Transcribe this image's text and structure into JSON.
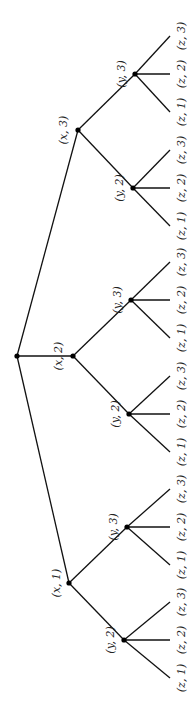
{
  "diagram": {
    "type": "tree",
    "orientation": "rotated-90-ccw",
    "colors": {
      "edge": "#111111",
      "node": "#000000",
      "label": "#222222",
      "background": "#ffffff"
    },
    "root": {
      "id": "root",
      "cx": 17,
      "cy": 356
    },
    "level1": [
      {
        "id": "x1",
        "label": "(x, 1)",
        "cx": 69,
        "cy": 583,
        "lx": 56,
        "ly": 583
      },
      {
        "id": "x2",
        "label": "(x, 2)",
        "cx": 73,
        "cy": 356,
        "lx": 58,
        "ly": 356
      },
      {
        "id": "x3",
        "label": "(x, 3)",
        "cx": 78,
        "cy": 130,
        "lx": 63,
        "ly": 130
      }
    ],
    "level2": [
      {
        "id": "x1y2",
        "parent": "x1",
        "label": "(y, 2)",
        "cx": 124,
        "cy": 640,
        "lx": 110,
        "ly": 640
      },
      {
        "id": "x1y3",
        "parent": "x1",
        "label": "(y, 3)",
        "cx": 127,
        "cy": 527,
        "lx": 113,
        "ly": 527
      },
      {
        "id": "x2y2",
        "parent": "x2",
        "label": "(y, 2)",
        "cx": 129,
        "cy": 414,
        "lx": 115,
        "ly": 414
      },
      {
        "id": "x2y3",
        "parent": "x2",
        "label": "(y, 3)",
        "cx": 131,
        "cy": 300,
        "lx": 117,
        "ly": 300
      },
      {
        "id": "x3y2",
        "parent": "x3",
        "label": "(y, 2)",
        "cx": 133,
        "cy": 188,
        "lx": 119,
        "ly": 188
      },
      {
        "id": "x3y3",
        "parent": "x3",
        "label": "(y, 3)",
        "cx": 135,
        "cy": 74,
        "lx": 121,
        "ly": 74
      }
    ],
    "leaves": [
      {
        "parent": "x1y2",
        "label": "(z, 1)",
        "x": 170,
        "y": 678
      },
      {
        "parent": "x1y2",
        "label": "(z, 2)",
        "x": 170,
        "y": 640
      },
      {
        "parent": "x1y2",
        "label": "(z, 3)",
        "x": 170,
        "y": 602
      },
      {
        "parent": "x1y3",
        "label": "(z, 1)",
        "x": 170,
        "y": 565
      },
      {
        "parent": "x1y3",
        "label": "(z, 2)",
        "x": 170,
        "y": 527
      },
      {
        "parent": "x1y3",
        "label": "(z, 3)",
        "x": 170,
        "y": 489
      },
      {
        "parent": "x2y2",
        "label": "(z, 1)",
        "x": 170,
        "y": 452
      },
      {
        "parent": "x2y2",
        "label": "(z, 2)",
        "x": 170,
        "y": 414
      },
      {
        "parent": "x2y2",
        "label": "(z, 3)",
        "x": 170,
        "y": 376
      },
      {
        "parent": "x2y3",
        "label": "(z, 1)",
        "x": 170,
        "y": 338
      },
      {
        "parent": "x2y3",
        "label": "(z, 2)",
        "x": 170,
        "y": 300
      },
      {
        "parent": "x2y3",
        "label": "(z, 3)",
        "x": 170,
        "y": 262
      },
      {
        "parent": "x3y2",
        "label": "(z, 1)",
        "x": 170,
        "y": 226
      },
      {
        "parent": "x3y2",
        "label": "(z, 2)",
        "x": 170,
        "y": 188
      },
      {
        "parent": "x3y2",
        "label": "(z, 3)",
        "x": 170,
        "y": 150
      },
      {
        "parent": "x3y3",
        "label": "(z, 1)",
        "x": 170,
        "y": 112
      },
      {
        "parent": "x3y3",
        "label": "(z, 2)",
        "x": 170,
        "y": 74
      },
      {
        "parent": "x3y3",
        "label": "(z, 3)",
        "x": 170,
        "y": 36
      }
    ],
    "leaf_label_x": 181
  }
}
